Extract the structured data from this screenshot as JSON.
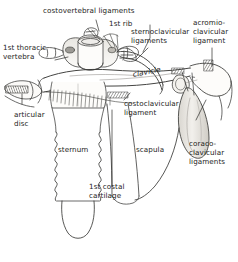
{
  "figure": {
    "background_color": "#ffffff",
    "ink_color": "#1d1d1b",
    "line_color": "#3a3a38",
    "shade_color": "#b9b6b0"
  },
  "labels": {
    "costovertebral_ligaments": "costovertebral ligaments",
    "first_rib": "1st rib",
    "sternoclavicular_ligaments_l1": "sternoclavicular",
    "sternoclavicular_ligaments_l2": "ligaments",
    "acromioclavicular_ligament_l1": "acromio-",
    "acromioclavicular_ligament_l2": "clavicular",
    "acromioclavicular_ligament_l3": "ligament",
    "first_thoracic_vertebra_l1": "1st thoracic",
    "first_thoracic_vertebra_l2": "vertebra",
    "clavicle": "clavicle",
    "costoclavicular_ligament_l1": "costoclavicular",
    "costoclavicular_ligament_l2": "ligament",
    "articular_disc_l1": "articular",
    "articular_disc_l2": "disc",
    "sternum": "sternum",
    "scapula": "scapula",
    "coracoclavicular_ligaments_l1": "coraco-",
    "coracoclavicular_ligaments_l2": "clavicular",
    "coracoclavicular_ligaments_l3": "ligaments",
    "first_costal_cartilage_l1": "1st costal",
    "first_costal_cartilage_l2": "cartilage"
  }
}
